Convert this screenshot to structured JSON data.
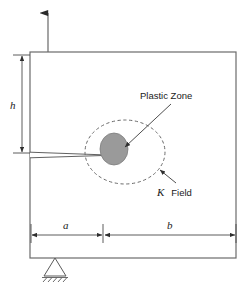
{
  "figure": {
    "type": "fracture-mechanics-schematic",
    "canvas": {
      "width": 246,
      "height": 292
    },
    "colors": {
      "background": "#ffffff",
      "outline": "#6b6b6b",
      "line": "#5a5a5a",
      "plastic_zone_fill": "#9a9a9a",
      "plastic_zone_stroke": "#7d7d7d",
      "kfield_stroke": "#6a6a6a",
      "text": "#1a1a1a"
    }
  },
  "annotations": {
    "plastic_zone_label": "Plastic Zone",
    "k_field_label_symbol": "K",
    "k_field_label_word": "Field",
    "height_label": "h",
    "crack_length_label": "a",
    "ligament_label": "b"
  },
  "geometry": {
    "specimen": {
      "x": 30,
      "y": 52,
      "width": 206,
      "height": 206
    },
    "crack": {
      "mouth_x": 30,
      "tip_x": 113,
      "y": 155,
      "mouth_half_opening": 2.6
    },
    "plastic_zone": {
      "cx": 114,
      "cy": 149,
      "rx": 14,
      "ry": 16
    },
    "k_field": {
      "cx": 125,
      "cy": 152,
      "rx": 40,
      "ry": 32
    },
    "load_arrow": {
      "x": 48,
      "y_top": 10,
      "y_bottom": 52
    },
    "support": {
      "apex_x": 55,
      "apex_y": 258,
      "base_y": 276,
      "half_width": 11
    },
    "dim_a": {
      "y": 235,
      "x1": 31,
      "x2": 103
    },
    "dim_b": {
      "y": 235,
      "x1": 104,
      "x2": 236
    },
    "dim_h": {
      "x": 22,
      "y1": 55,
      "y2": 153
    }
  },
  "elements": {
    "load_arrow_name": "load-arrow-up",
    "support_name": "roller-support",
    "specimen_name": "specimen-body"
  }
}
